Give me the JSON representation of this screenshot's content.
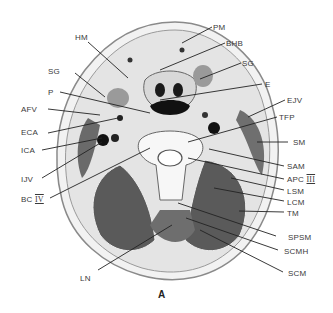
{
  "figure": {
    "caption": "A",
    "labels_left": [
      {
        "id": "HM",
        "text": "HM",
        "x": 75,
        "y": 33,
        "tx": 128,
        "ty": 78
      },
      {
        "id": "SG-left",
        "text": "SG",
        "x": 48,
        "y": 67,
        "tx": 105,
        "ty": 97
      },
      {
        "id": "P",
        "text": "P",
        "x": 48,
        "y": 88,
        "tx": 150,
        "ty": 113
      },
      {
        "id": "AFV",
        "text": "AFV",
        "x": 21,
        "y": 106,
        "tx": 100,
        "ty": 115
      },
      {
        "id": "ECA",
        "text": "ECA",
        "x": 21,
        "y": 128,
        "tx": 118,
        "ty": 118
      },
      {
        "id": "ICA",
        "text": "ICA",
        "x": 21,
        "y": 147,
        "tx": 102,
        "ty": 138
      },
      {
        "id": "IJV",
        "text": "IJV",
        "x": 21,
        "y": 175,
        "tx": 102,
        "ty": 142
      },
      {
        "id": "BC-IV",
        "text": "BC",
        "roman": "IV",
        "x": 21,
        "y": 195,
        "tx": 150,
        "ty": 148
      },
      {
        "id": "LN",
        "text": "LN",
        "x": 80,
        "y": 275,
        "tx": 172,
        "ty": 225
      }
    ],
    "labels_right": [
      {
        "id": "PM",
        "text": "PM",
        "x": 212,
        "y": 23,
        "tx": 182,
        "ty": 43
      },
      {
        "id": "BHB",
        "text": "BHB",
        "x": 226,
        "y": 39,
        "tx": 160,
        "ty": 70
      },
      {
        "id": "SG-right",
        "text": "SG",
        "x": 242,
        "y": 59,
        "tx": 200,
        "ty": 79
      },
      {
        "id": "E",
        "text": "E",
        "x": 264,
        "y": 80,
        "tx": 160,
        "ty": 100
      },
      {
        "id": "EJV",
        "text": "EJV",
        "x": 287,
        "y": 96,
        "tx": 248,
        "ty": 117
      },
      {
        "id": "TFP",
        "text": "TFP",
        "x": 279,
        "y": 113,
        "tx": 188,
        "ty": 142
      },
      {
        "id": "SM",
        "text": "SM",
        "x": 294,
        "y": 138,
        "tx": 257,
        "ty": 142
      },
      {
        "id": "SAM",
        "text": "SAM",
        "x": 286,
        "y": 162,
        "tx": 209,
        "ty": 149
      },
      {
        "id": "APC-III",
        "text": "APC",
        "roman": "III",
        "x": 286,
        "y": 176,
        "tx": 188,
        "ty": 158
      },
      {
        "id": "LSM",
        "text": "LSM",
        "x": 286,
        "y": 188,
        "tx": 231,
        "ty": 178
      },
      {
        "id": "LCM",
        "text": "LCM",
        "x": 286,
        "y": 199,
        "tx": 214,
        "ty": 188
      },
      {
        "id": "TM",
        "text": "TM",
        "x": 286,
        "y": 210,
        "tx": 239,
        "ty": 211
      },
      {
        "id": "SPSM",
        "text": "SPSM",
        "x": 286,
        "y": 234,
        "tx": 178,
        "ty": 203
      },
      {
        "id": "SCMH",
        "text": "SCMH",
        "x": 286,
        "y": 248,
        "tx": 186,
        "ty": 218
      },
      {
        "id": "SCM",
        "text": "SCM",
        "x": 286,
        "y": 270,
        "tx": 200,
        "ty": 230
      }
    ]
  }
}
